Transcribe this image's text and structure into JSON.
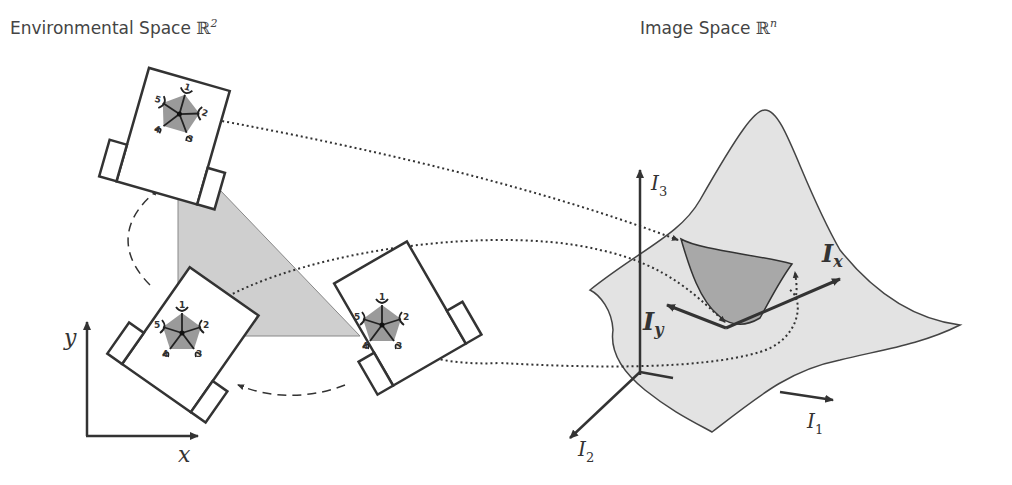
{
  "titles": {
    "left": "Environmental Space ",
    "left_set": "ℝ",
    "left_exp": "2",
    "right": "Image Space ",
    "right_set": "ℝ",
    "right_exp": "n"
  },
  "axes_env": {
    "x": "x",
    "y": "y"
  },
  "axes_image": {
    "i1": "I",
    "i1_sub": "1",
    "i2": "I",
    "i2_sub": "2",
    "i3": "I",
    "i3_sub": "3"
  },
  "gradient_labels": {
    "ix": "I",
    "ix_sub": "x",
    "iy": "I",
    "iy_sub": "y"
  },
  "sensor_numbers": [
    "1",
    "2",
    "3",
    "4",
    "5"
  ],
  "colors": {
    "surface": "#e3e3e3",
    "patch": "#a8a8a8",
    "triangle": "#cfcfcf",
    "pentagon": "#9a9a9a",
    "stroke": "#333333"
  }
}
